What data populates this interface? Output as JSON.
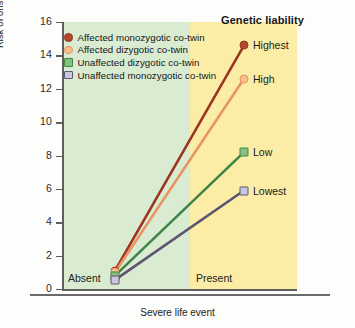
{
  "chart_data": {
    "type": "line",
    "title": "",
    "xlabel": "Severe life event",
    "ylabel": "Risk of onset of major depression (percent)",
    "categories": [
      "Absent",
      "Present"
    ],
    "ylim": [
      0,
      16
    ],
    "yticks": [
      "0",
      "2",
      "4",
      "6",
      "8",
      "10",
      "12",
      "14",
      "16"
    ],
    "grid": false,
    "legend_position": "top-left inside plot",
    "series": [
      {
        "name": "Affected monozygotic co-twin",
        "end_label": "Highest",
        "color": "#9c3520",
        "marker": "circle",
        "marker_fill": "#b3472b",
        "values": [
          1.1,
          14.6
        ]
      },
      {
        "name": "Affected dizygotic co-twin",
        "end_label": "High",
        "color": "#e89464",
        "marker": "circle",
        "marker_fill": "#f5c08e",
        "values": [
          1.0,
          12.6
        ]
      },
      {
        "name": "Unaffected dizygotic co-twin",
        "end_label": "Low",
        "color": "#3f8449",
        "marker": "square",
        "marker_fill": "#89c07a",
        "values": [
          0.8,
          8.2
        ]
      },
      {
        "name": "Unaffected monozygotic co-twin",
        "end_label": "Lowest",
        "color": "#5d5470",
        "marker": "square",
        "marker_fill": "#c9c7dd",
        "values": [
          0.55,
          5.9
        ]
      }
    ],
    "annotations": {
      "genetic_liability_title": "Genetic liability"
    },
    "bands": [
      {
        "label": "Absent",
        "color": "#d9ecd2"
      },
      {
        "label": "Present",
        "color": "#fbeda6"
      }
    ]
  }
}
